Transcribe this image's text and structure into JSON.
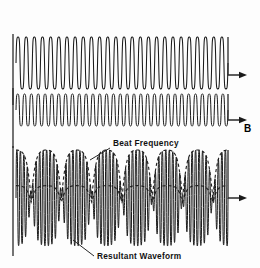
{
  "figure": {
    "letter": "B",
    "background_color": "#fdfdfd",
    "stroke_color": "#1a1a1a",
    "width": 260,
    "height": 268
  },
  "labels": {
    "beat_frequency": "Beat Frequency",
    "resultant_waveform": "Resultant Waveform"
  },
  "chart_data": {
    "type": "line",
    "title": "",
    "xlabel": "",
    "ylabel": "",
    "grid": false,
    "legend_position": "none",
    "series": [
      {
        "name": "Wave 1",
        "trace_index": 0,
        "waveform": "sine",
        "cycles_visible": 26,
        "amplitude": 26,
        "baseline_y": 63,
        "x_start": 16,
        "x_end": 228,
        "arrow_end": true,
        "axis_y_label": "",
        "annotation": ""
      },
      {
        "name": "Wave 2",
        "trace_index": 1,
        "waveform": "sine",
        "cycles_visible": 31,
        "amplitude": 16,
        "baseline_y": 110,
        "x_start": 16,
        "x_end": 228,
        "arrow_end": true,
        "axis_y_label": "",
        "annotation": ""
      },
      {
        "name": "Resultant Waveform",
        "trace_index": 2,
        "waveform": "beat-sum",
        "cycles_visible": 57,
        "beat_groups": 7,
        "amplitude": 48,
        "baseline_y": 198,
        "x_start": 16,
        "x_end": 228,
        "arrow_end": true,
        "axis_y_label": "",
        "annotation": "Resultant Waveform"
      }
    ],
    "annotations": [
      {
        "text": "Beat Frequency",
        "target": "envelope",
        "x": 112,
        "y": 145
      },
      {
        "text": "Resultant Waveform",
        "target": "resultant-trace",
        "x": 96,
        "y": 258
      }
    ],
    "axis_ranges": {
      "x": [
        16,
        228
      ],
      "y": [
        0,
        268
      ]
    }
  }
}
